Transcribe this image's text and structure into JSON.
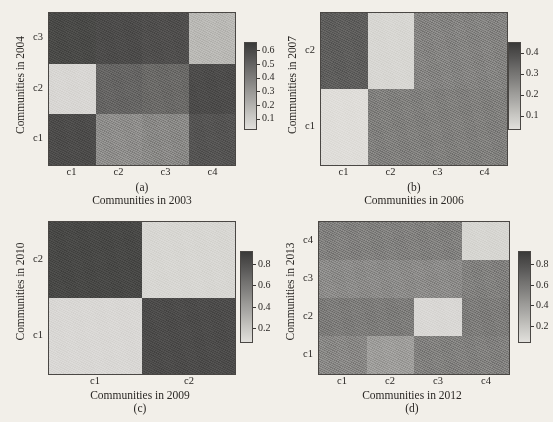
{
  "figure": {
    "background_color": "#f2efe9",
    "text_color": "#2a2724",
    "colormap": "grayscale"
  },
  "chart_data": [
    {
      "type": "heatmap",
      "panel_letter": "(a)",
      "letter_position": "above-xlabel",
      "xlabel": "Communities in 2003",
      "ylabel": "Communities in 2004",
      "xticklabels": [
        "c1",
        "c2",
        "c3",
        "c4"
      ],
      "yticklabels": [
        "c1",
        "c2",
        "c3"
      ],
      "ytick_order": "bottom-to-top",
      "rows": 3,
      "cols": 4,
      "colorbar": {
        "ticks": [
          0.1,
          0.2,
          0.3,
          0.4,
          0.5,
          0.6
        ],
        "ticklabels": [
          "0.1",
          "0.2",
          "0.3",
          "0.4",
          "0.5",
          "0.6"
        ],
        "vmin": 0.03,
        "vmax": 0.66,
        "position": "right"
      },
      "row_labels_top_to_bottom": [
        "c3",
        "c2",
        "c1"
      ],
      "values_top_to_bottom": [
        [
          0.08,
          0.09,
          0.1,
          0.5
        ],
        [
          0.62,
          0.18,
          0.2,
          0.09
        ],
        [
          0.09,
          0.33,
          0.31,
          0.12
        ]
      ]
    },
    {
      "type": "heatmap",
      "panel_letter": "(b)",
      "letter_position": "above-xlabel",
      "xlabel": "Communities in 2006",
      "ylabel": "Communities in 2007",
      "xticklabels": [
        "c1",
        "c2",
        "c3",
        "c4"
      ],
      "yticklabels": [
        "c1",
        "c2"
      ],
      "ytick_order": "bottom-to-top",
      "rows": 2,
      "cols": 4,
      "colorbar": {
        "ticks": [
          0.1,
          0.2,
          0.3,
          0.4
        ],
        "ticklabels": [
          "0.1",
          "0.2",
          "0.3",
          "0.4"
        ],
        "vmin": 0.04,
        "vmax": 0.45,
        "position": "right"
      },
      "row_labels_top_to_bottom": [
        "c2",
        "c1"
      ],
      "values_top_to_bottom": [
        [
          0.12,
          0.42,
          0.21,
          0.21
        ],
        [
          0.44,
          0.2,
          0.2,
          0.2
        ]
      ]
    },
    {
      "type": "heatmap",
      "panel_letter": "(c)",
      "letter_position": "below-xlabel",
      "xlabel": "Communities in 2009",
      "ylabel": "Communities in 2010",
      "xticklabels": [
        "c1",
        "c2"
      ],
      "yticklabels": [
        "c1",
        "c2"
      ],
      "ytick_order": "bottom-to-top",
      "rows": 2,
      "cols": 2,
      "colorbar": {
        "ticks": [
          0.2,
          0.4,
          0.6,
          0.8
        ],
        "ticklabels": [
          "0.2",
          "0.4",
          "0.6",
          "0.8"
        ],
        "vmin": 0.08,
        "vmax": 0.92,
        "position": "right"
      },
      "row_labels_top_to_bottom": [
        "c2",
        "c1"
      ],
      "values_top_to_bottom": [
        [
          0.14,
          0.86
        ],
        [
          0.87,
          0.16
        ]
      ]
    },
    {
      "type": "heatmap",
      "panel_letter": "(d)",
      "letter_position": "below-xlabel",
      "xlabel": "Communities in 2012",
      "ylabel": "Communities in 2013",
      "xticklabels": [
        "c1",
        "c2",
        "c3",
        "c4"
      ],
      "yticklabels": [
        "c1",
        "c2",
        "c3",
        "c4"
      ],
      "ytick_order": "bottom-to-top",
      "rows": 4,
      "cols": 4,
      "colorbar": {
        "ticks": [
          0.2,
          0.4,
          0.6,
          0.8
        ],
        "ticklabels": [
          "0.2",
          "0.4",
          "0.6",
          "0.8"
        ],
        "vmin": 0.05,
        "vmax": 0.93,
        "position": "right"
      },
      "row_labels_top_to_bottom": [
        "c4",
        "c3",
        "c2",
        "c1"
      ],
      "values_top_to_bottom": [
        [
          0.4,
          0.4,
          0.4,
          0.86
        ],
        [
          0.46,
          0.46,
          0.46,
          0.4
        ],
        [
          0.38,
          0.38,
          0.88,
          0.38
        ],
        [
          0.44,
          0.56,
          0.4,
          0.4
        ]
      ]
    }
  ],
  "panels": [
    {
      "name": "panel-a",
      "letter": "(a)",
      "xlabel": "Communities in 2003",
      "ylabel": "Communities in 2004"
    },
    {
      "name": "panel-b",
      "letter": "(b)",
      "xlabel": "Communities in 2006",
      "ylabel": "Communities in 2007"
    },
    {
      "name": "panel-c",
      "letter": "(c)",
      "xlabel": "Communities in 2009",
      "ylabel": "Communities in 2010"
    },
    {
      "name": "panel-d",
      "letter": "(d)",
      "xlabel": "Communities in 2012",
      "ylabel": "Communities in 2013"
    }
  ]
}
